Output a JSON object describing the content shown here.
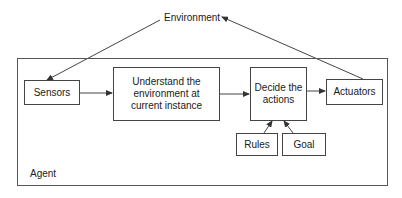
{
  "diagram": {
    "environment": {
      "label": "Environment"
    },
    "agent": {
      "label": "Agent"
    },
    "nodes": {
      "sensors": {
        "label": "Sensors"
      },
      "understand": {
        "label": "Understand the\nenvironment at\ncurrent instance"
      },
      "decide": {
        "label": "Decide the\nactions"
      },
      "actuators": {
        "label": "Actuators"
      },
      "rules": {
        "label": "Rules"
      },
      "goal": {
        "label": "Goal"
      }
    },
    "edges": [
      {
        "from": "environment",
        "to": "sensors"
      },
      {
        "from": "sensors",
        "to": "understand"
      },
      {
        "from": "understand",
        "to": "decide"
      },
      {
        "from": "decide",
        "to": "actuators"
      },
      {
        "from": "actuators",
        "to": "environment"
      },
      {
        "from": "rules",
        "to": "decide"
      },
      {
        "from": "goal",
        "to": "decide"
      }
    ],
    "colors": {
      "line": "#444444",
      "background": "#ffffff"
    }
  }
}
